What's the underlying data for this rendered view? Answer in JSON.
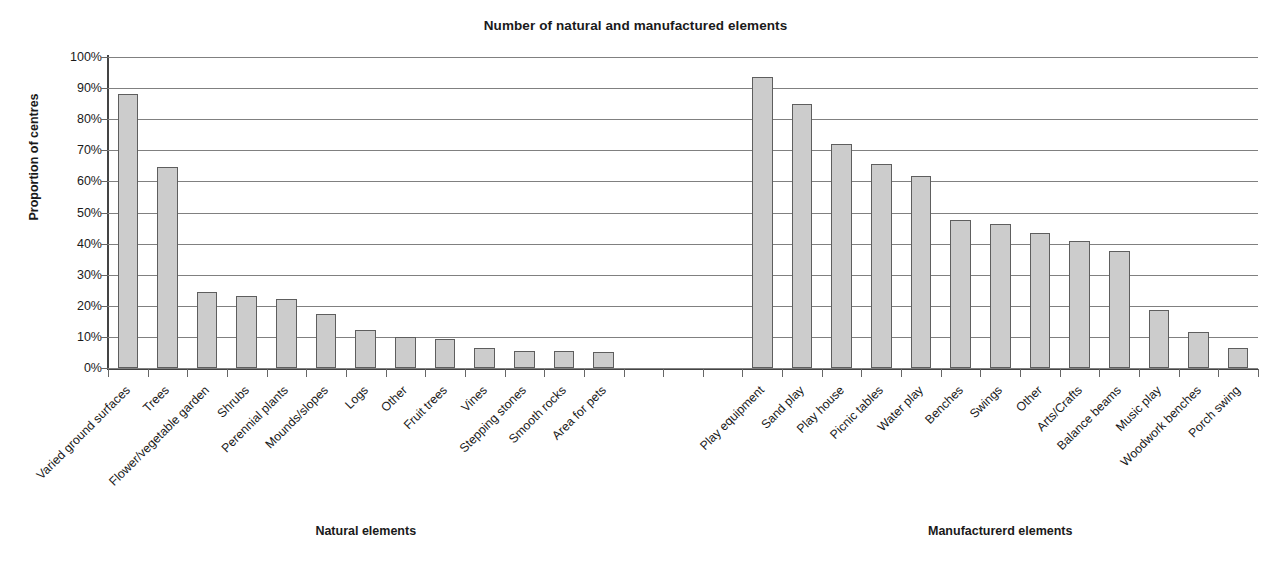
{
  "chart_data": {
    "type": "bar",
    "title": "Number of natural and manufactured elements",
    "xlabel": "",
    "ylabel": "Proportion of centres",
    "ylim": [
      0,
      100
    ],
    "ytick_labels": [
      "100%",
      "90%",
      "80%",
      "70%",
      "60%",
      "50%",
      "40%",
      "30%",
      "20%",
      "10%",
      "0%"
    ],
    "ytick_values": [
      100,
      90,
      80,
      70,
      60,
      50,
      40,
      30,
      20,
      10,
      0
    ],
    "grid": true,
    "legend": "none",
    "groups": [
      {
        "name": "Natural elements",
        "categories": [
          "Varied ground surfaces",
          "Trees",
          "Flower/vegetable garden",
          "Shrubs",
          "Perennial plants",
          "Mounds/slopes",
          "Logs",
          "Other",
          "Fruit trees",
          "Vines",
          "Stepping stones",
          "Smooth rocks",
          "Area for pets"
        ],
        "values": [
          88.2,
          64.5,
          24.5,
          23.2,
          22.1,
          17.3,
          12.3,
          10.1,
          9.2,
          6.5,
          5.6,
          5.4,
          5.3
        ]
      },
      {
        "name": "Manufacturerd elements",
        "categories": [
          "Play equipment",
          "Sand play",
          "Play house",
          "Picnic tables",
          "Water play",
          "Benches",
          "Swings",
          "Other",
          "Arts/Crafts",
          "Balance beams",
          "Music play",
          "Woodwork benches",
          "Porch swing"
        ],
        "values": [
          93.5,
          84.8,
          72.0,
          65.7,
          61.6,
          47.5,
          46.2,
          43.4,
          40.9,
          37.6,
          18.5,
          11.5,
          6.4
        ]
      }
    ],
    "gap_slots": 3
  }
}
